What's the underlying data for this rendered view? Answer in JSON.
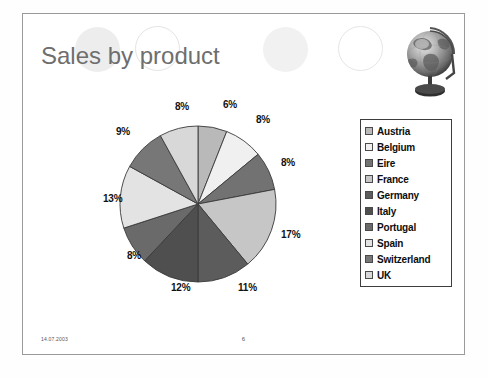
{
  "slide": {
    "title": "Sales by product",
    "footer_date": "14.07.2003",
    "footer_page": "6"
  },
  "decorations": {
    "circle_filled_1": "decorative-circle",
    "circle_outline_1": "decorative-circle",
    "circle_filled_2": "decorative-circle",
    "circle_outline_2": "decorative-circle",
    "globe": "globe-image"
  },
  "colors": {
    "title": "#6e6e6e",
    "slide_border": "#9a9a9a",
    "legend_border": "#3d3d3d",
    "label_text": "#111111",
    "slice_outline": "#3a3a3a"
  },
  "chart_data": {
    "type": "pie",
    "title": "Sales by product",
    "legend_position": "right",
    "start_angle_deg": 0,
    "direction": "clockwise",
    "categories": [
      "Austria",
      "Belgium",
      "Eire",
      "France",
      "Germany",
      "Italy",
      "Portugal",
      "Spain",
      "Switzerland",
      "UK"
    ],
    "values": [
      6,
      8,
      8,
      17,
      11,
      12,
      8,
      13,
      9,
      8
    ],
    "value_labels": [
      "6%",
      "8%",
      "8%",
      "17%",
      "11%",
      "12%",
      "8%",
      "13%",
      "9%",
      "8%"
    ],
    "colors": [
      "#b9b9b9",
      "#f0f0f0",
      "#727272",
      "#c6c6c6",
      "#5c5c5c",
      "#4f4f4f",
      "#6a6a6a",
      "#e3e3e3",
      "#777777",
      "#d8d8d8"
    ],
    "total": 100,
    "unit": "%"
  },
  "labels": [
    {
      "text": "6%",
      "left": 200,
      "top": 0
    },
    {
      "text": "8%",
      "left": 233,
      "top": 15
    },
    {
      "text": "8%",
      "left": 258,
      "top": 58
    },
    {
      "text": "17%",
      "left": 258,
      "top": 130
    },
    {
      "text": "11%",
      "left": 215,
      "top": 183
    },
    {
      "text": "12%",
      "left": 148,
      "top": 183
    },
    {
      "text": "8%",
      "left": 104,
      "top": 151
    },
    {
      "text": "13%",
      "left": 80,
      "top": 94
    },
    {
      "text": "9%",
      "left": 93,
      "top": 27
    },
    {
      "text": "8%",
      "left": 152,
      "top": 2
    }
  ]
}
